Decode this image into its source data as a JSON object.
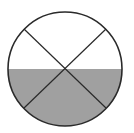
{
  "diagram": {
    "type": "circle-fraction",
    "circle": {
      "cx": 65,
      "cy": 69,
      "r": 57,
      "stroke": "#2a2a2a",
      "stroke_width": 1.6
    },
    "diagonals": [
      {
        "x1": 24,
        "y1": 29,
        "x2": 106,
        "y2": 108
      },
      {
        "x1": 106,
        "y1": 29,
        "x2": 24,
        "y2": 108
      }
    ],
    "shaded_region": {
      "from_y": 69,
      "fill": "#a0a0a0",
      "fraction": "1/2"
    },
    "colors": {
      "background": "#ffffff",
      "line": "#2a2a2a",
      "shade": "#a0a0a0"
    }
  }
}
